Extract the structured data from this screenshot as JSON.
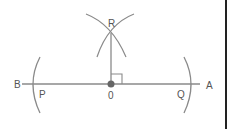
{
  "diagram": {
    "points": {
      "A": "A",
      "B": "B",
      "P": "P",
      "Q": "Q",
      "O": "0",
      "R": "R"
    },
    "colors": {
      "line": "#888888",
      "point": "#666666",
      "border": "#222222"
    }
  }
}
